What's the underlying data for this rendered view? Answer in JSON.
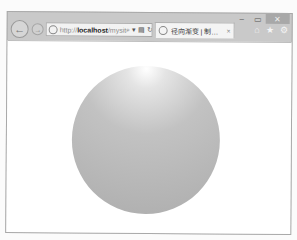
{
  "browser": {
    "window_controls": {
      "minimize": "–",
      "maximize": "▭",
      "close": "✕"
    },
    "nav": {
      "back_icon": "←",
      "forward_icon": "→"
    },
    "address_bar": {
      "url_protocol": "http://",
      "url_host": "localhost",
      "url_rest": "/mysit",
      "search_icon": "⌕",
      "dropdown_icon": "▾",
      "compat_icon": "▤",
      "refresh_icon": "↻"
    },
    "tab": {
      "title": "径向渐变 | 制作圆形...",
      "close_icon": "×"
    },
    "tools": {
      "home_icon": "⌂",
      "favorites_icon": "★",
      "settings_icon": "⚙"
    }
  },
  "content": {
    "circle": {
      "shape": "circle",
      "fill": "radial-gradient",
      "colors": {
        "highlight": "#ffffff",
        "mid": "#c2c2c2",
        "edge": "#adadad"
      }
    },
    "page_background": "#ffffff"
  }
}
